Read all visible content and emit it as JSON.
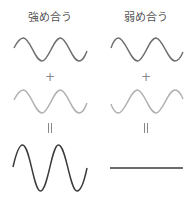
{
  "columns": [
    {
      "id": "constructive",
      "title": "強め合う",
      "plus_symbol": "+",
      "equals_symbol": "II",
      "wave1": {
        "color": "#6e6e6e",
        "amplitude": 11,
        "phase": "in-phase"
      },
      "wave2": {
        "color": "#b0b0b0",
        "amplitude": 11,
        "phase": "in-phase"
      },
      "result": {
        "color": "#3a3a3a",
        "amplitude": 22,
        "shape": "sine"
      }
    },
    {
      "id": "destructive",
      "title": "弱め合う",
      "plus_symbol": "+",
      "equals_symbol": "II",
      "wave1": {
        "color": "#6e6e6e",
        "amplitude": 11,
        "phase": "0"
      },
      "wave2": {
        "color": "#b0b0b0",
        "amplitude": 11,
        "phase": "180deg-inverted"
      },
      "result": {
        "color": "#3a3a3a",
        "amplitude": 0,
        "shape": "flat-line"
      }
    }
  ]
}
